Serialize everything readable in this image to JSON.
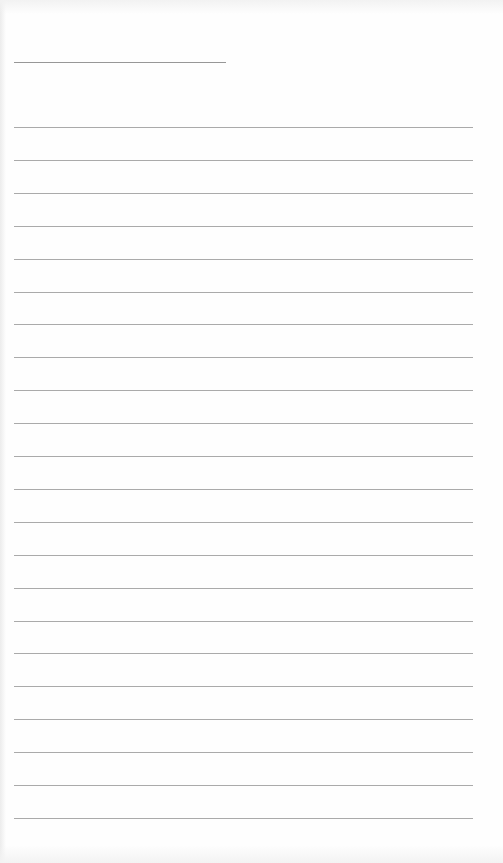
{
  "sheet": {
    "type": "lined-paper",
    "background": "#fefefe",
    "line_color": "#8d8d8d",
    "title_line": {
      "x": 14,
      "y": 62,
      "width": 212
    },
    "ruled_lines": {
      "x": 14,
      "width": 459,
      "first_y": 127,
      "spacing": 32.9,
      "count": 22
    },
    "text": []
  }
}
